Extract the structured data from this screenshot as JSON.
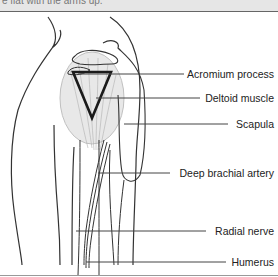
{
  "header": {
    "cut_off_text": "e flat with the arms up."
  },
  "figure": {
    "labels": [
      {
        "text": "Acromium process",
        "y": 74
      },
      {
        "text": "Deltoid muscle",
        "y": 98
      },
      {
        "text": "Scapula",
        "y": 124
      },
      {
        "text": "Deep brachial artery",
        "y": 173
      },
      {
        "text": "Radial nerve",
        "y": 231
      },
      {
        "text": "Humerus",
        "y": 262
      }
    ],
    "colors": {
      "outline": "#333333",
      "muscle": "#bdbdbd",
      "triangle": "#1a1a1a",
      "leader": "#444444"
    }
  }
}
